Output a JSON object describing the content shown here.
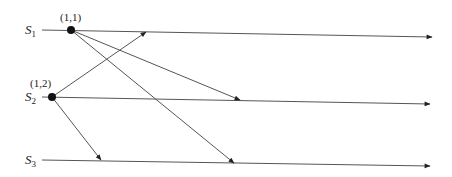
{
  "diagram": {
    "processes": [
      {
        "name": "S",
        "sub": "1",
        "label_x": 25,
        "label_y": 34,
        "x1": 42,
        "y1": 30,
        "x2": 432,
        "y2": 37
      },
      {
        "name": "S",
        "sub": "2",
        "label_x": 25,
        "label_y": 101,
        "x1": 42,
        "y1": 97,
        "x2": 430,
        "y2": 104
      },
      {
        "name": "S",
        "sub": "3",
        "label_x": 25,
        "label_y": 164,
        "x1": 42,
        "y1": 160,
        "x2": 430,
        "y2": 166
      }
    ],
    "events": [
      {
        "label": "(1,1)",
        "x": 71,
        "y": 30,
        "label_x": 60,
        "label_y": 21
      },
      {
        "label": "(1,2)",
        "x": 52,
        "y": 97,
        "label_x": 30,
        "label_y": 87
      }
    ],
    "messages": [
      {
        "from": "(1,2)",
        "x1": 52,
        "y1": 97,
        "x2": 146,
        "y2": 32
      },
      {
        "from": "(1,1)",
        "x1": 71,
        "y1": 30,
        "x2": 240,
        "y2": 100
      },
      {
        "from": "(1,1)",
        "x1": 71,
        "y1": 30,
        "x2": 234,
        "y2": 163
      },
      {
        "from": "(1,2)",
        "x1": 52,
        "y1": 97,
        "x2": 101,
        "y2": 160
      }
    ],
    "colors": {
      "line": "#555555",
      "dot": "#111111",
      "text": "#222222"
    }
  }
}
